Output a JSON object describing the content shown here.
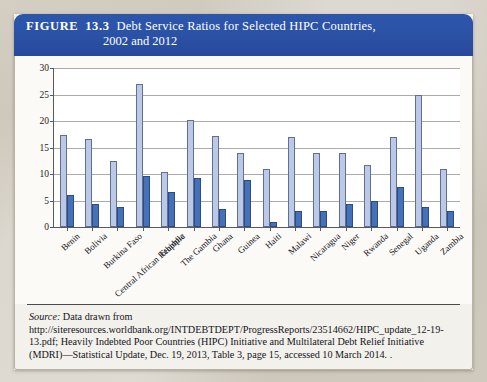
{
  "figure": {
    "label": "FIGURE",
    "number": "13.3",
    "title_line1": "Debt Service Ratios for Selected HIPC Countries,",
    "title_line2": "2002 and 2012",
    "header_color": "#2a51a4"
  },
  "legend": {
    "position": "top-right",
    "items": [
      {
        "label": "2002",
        "color": "#cfd9ee"
      },
      {
        "label": "2012",
        "color": "#4571b8"
      }
    ]
  },
  "source": {
    "prefix": "Source:",
    "text": " Data drawn from http://siteresources.worldbank.org/INTDEBTDEPT/ProgressReports/23514662/HIPC_update_12-19-13.pdf; Heavily Indebted Poor Countries (HIPC) Initiative and Multilateral Debt Relief Initiative (MDRI)—Statistical Update, Dec. 19, 2013, Table 3, page 15, accessed 10 March 2014. ."
  },
  "chart_data": {
    "type": "bar",
    "title": "Debt Service Ratios for Selected HIPC Countries, 2002 and 2012",
    "xlabel": "",
    "ylabel": "",
    "ylim": [
      0,
      30
    ],
    "yticks": [
      0,
      5,
      10,
      15,
      20,
      25,
      30
    ],
    "grid": true,
    "legend_position": "top-right",
    "categories": [
      "Benin",
      "Bolivia",
      "Burkina Faso",
      "Central African Reupblic",
      "Ethiopia",
      "The Gambia",
      "Ghana",
      "Guinea",
      "Haiti",
      "Malawi",
      "Nicaragua",
      "Niger",
      "Rwanda",
      "Senegal",
      "Uganda",
      "Zambia"
    ],
    "series": [
      {
        "name": "2002",
        "color": "#bcc9e6",
        "values": [
          17.3,
          16.6,
          12.4,
          26.9,
          10.3,
          20.2,
          17.1,
          14.0,
          11.0,
          17.0,
          14.0,
          14.0,
          11.7,
          17.0,
          25.0,
          11.0
        ]
      },
      {
        "name": "2012",
        "color": "#4571b8",
        "values": [
          6.0,
          4.3,
          3.8,
          9.7,
          6.6,
          9.3,
          3.4,
          8.8,
          1.0,
          3.0,
          3.0,
          4.3,
          5.0,
          7.5,
          3.8,
          3.0
        ]
      }
    ]
  }
}
